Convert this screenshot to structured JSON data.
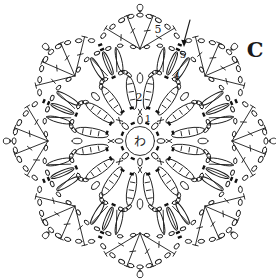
{
  "figure": {
    "variant_label": "C",
    "center_label": "わ",
    "labels": {
      "round1": "1",
      "round2": "2",
      "round4": "4",
      "round5_start": "5",
      "top_chain_count": "5"
    },
    "motif": {
      "type": "crochet-motif-chart",
      "petals": 8,
      "rounds_labeled": [
        "1",
        "2",
        "4",
        "5"
      ]
    },
    "symbols": [
      "magic-ring",
      "chain-stitch",
      "single-crochet-x",
      "treble-crochet",
      "treble-cluster",
      "picot",
      "slip-stitch-mark",
      "start-arrow"
    ],
    "colors": {
      "line": "#1a1a1a",
      "background": "#ffffff"
    }
  }
}
